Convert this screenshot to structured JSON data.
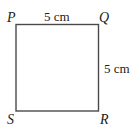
{
  "diagram": {
    "shape": "square",
    "vertices": {
      "top_left": "P",
      "top_right": "Q",
      "bottom_right": "R",
      "bottom_left": "S"
    },
    "measurements": {
      "top_side": "5 cm",
      "right_side": "5 cm"
    },
    "colors": {
      "stroke": "#4a4a4a",
      "text": "#222222",
      "background": "#ffffff"
    }
  }
}
